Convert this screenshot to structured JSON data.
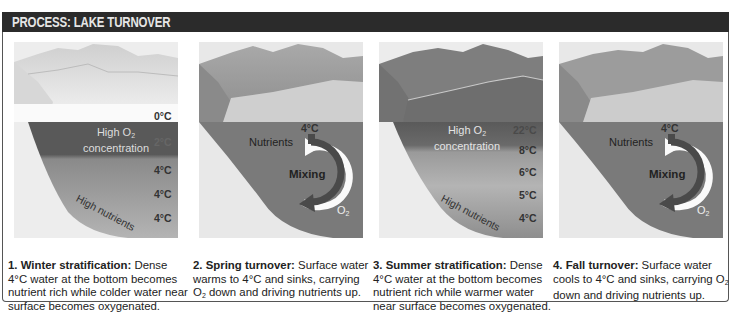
{
  "header": {
    "title": "PROCESS: LAKE TURNOVER"
  },
  "panels": [
    {
      "id": "winter",
      "high_o2_line1": "High O",
      "high_o2_sub": "2",
      "high_o2_line2": "concentration",
      "temps": [
        "0°C",
        "2°C",
        "4°C",
        "4°C",
        "4°C"
      ],
      "nutrients_label": "High nutrients",
      "caption_title": "1. Winter stratification:",
      "caption_text": " Dense 4°C water at the bottom becomes nutrient rich while colder water near surface becomes oxygenated."
    },
    {
      "id": "spring",
      "top_temp": "4°C",
      "nutrients_label": "Nutrients",
      "mixing_label": "Mixing",
      "o2_label": "O",
      "o2_sub": "2",
      "caption_title": "2. Spring turnover:",
      "caption_text_1": " Surface water warms to 4°C and sinks, carrying O",
      "caption_sub": "2",
      "caption_text_2": " down and driving nutrients up."
    },
    {
      "id": "summer",
      "high_o2_line1": "High O",
      "high_o2_sub": "2",
      "high_o2_line2": "concentration",
      "temps": [
        "22°C",
        "8°C",
        "6°C",
        "5°C",
        "4°C"
      ],
      "nutrients_label": "High nutrients",
      "caption_title": "3. Summer stratification:",
      "caption_text": " Dense 4°C water at the bottom becomes nutrient rich while warmer water near surface becomes oxygenated."
    },
    {
      "id": "fall",
      "top_temp": "4°C",
      "nutrients_label": "Nutrients",
      "mixing_label": "Mixing",
      "o2_label": "O",
      "o2_sub": "2",
      "caption_title": "4. Fall turnover:",
      "caption_text_1": " Surface water cools to 4°C and sinks, carrying O",
      "caption_sub": "2",
      "caption_text_2": " down and driving nutrients up."
    }
  ],
  "colors": {
    "header_bg": "#2b2b2b",
    "deep_layer": "#5c5c5c",
    "mid_layer": "#8e8e8e",
    "light_layer": "#a8a8a8",
    "mixing_water": "#7b7b7b",
    "shore": "#e4e4e4"
  }
}
